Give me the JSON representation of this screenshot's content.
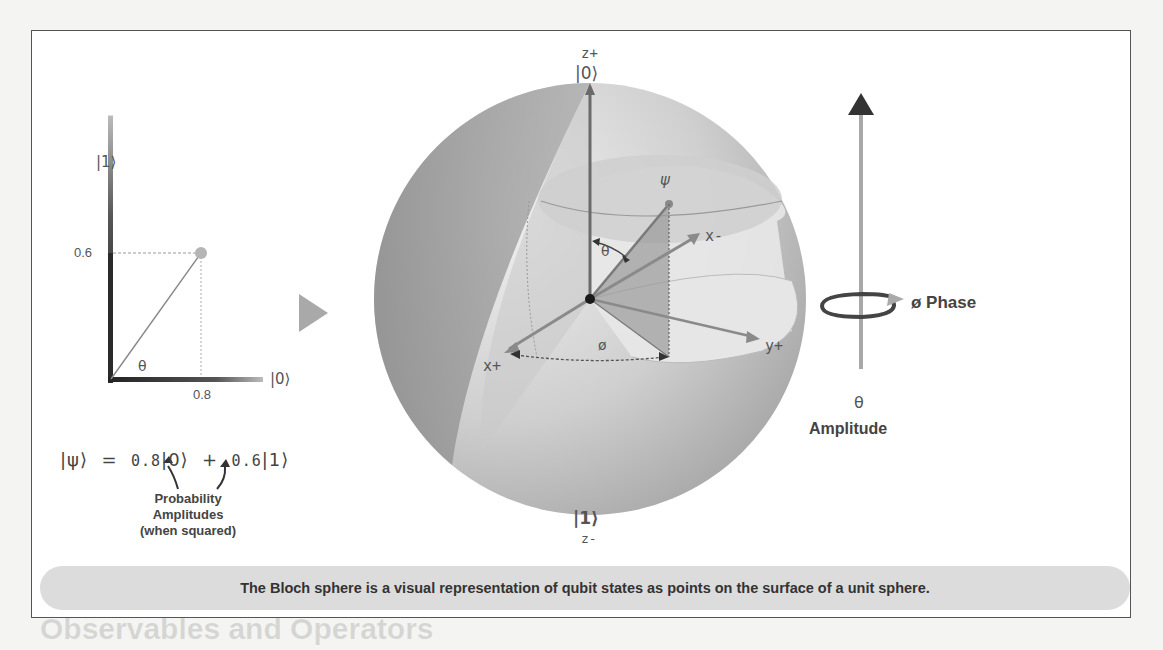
{
  "background": {
    "ghost_heading": "Observables and Operators"
  },
  "figure": {
    "left_diagram": {
      "y_axis_label": "|1⟩",
      "x_axis_label": "|0⟩",
      "y_tick": "0.6",
      "x_tick": "0.8",
      "angle_label": "θ",
      "point": {
        "x": 0.8,
        "y": 0.6
      }
    },
    "equation": {
      "lhs": "|ψ⟩",
      "equals": "=",
      "coef0": "0.8",
      "ket0": "|0⟩",
      "plus": "+",
      "coef1": "0.6",
      "ket1": "|1⟩"
    },
    "annotation": {
      "line1": "Probability",
      "line2": "Amplitudes",
      "line3": "(when squared)"
    },
    "bloch_sphere": {
      "z_plus_label": "z+",
      "top_ket": "|0⟩",
      "bottom_ket": "|1⟩",
      "z_minus_label": "z-",
      "psi_label": "ψ",
      "theta_label": "θ",
      "phi_label": "ø",
      "x_plus_label": "x+",
      "x_minus_label": "x-",
      "y_plus_label": "y+"
    },
    "right_diagram": {
      "phase_label": "ø Phase",
      "theta_label": "θ",
      "amplitude_label": "Amplitude"
    },
    "caption": "The Bloch sphere is a visual representation of qubit states as points on the surface of a unit sphere.",
    "colors": {
      "sphere_light": "#e2e2e2",
      "sphere_mid": "#bdbdbd",
      "sphere_dark": "#8e8e8e",
      "axis_dark": "#444444",
      "caption_band": "#dcdcdc"
    }
  }
}
